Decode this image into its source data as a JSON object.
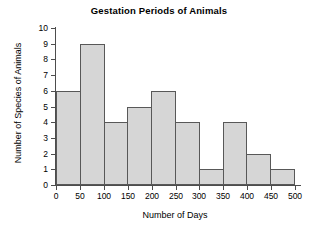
{
  "chart_data": {
    "type": "bar",
    "title": "Gestation Periods of Animals",
    "xlabel": "Number of Days",
    "ylabel": "Number of Species of Animals",
    "categories": [
      "0-50",
      "50-100",
      "100-150",
      "150-200",
      "200-250",
      "250-300",
      "300-350",
      "350-400",
      "400-450",
      "450-500"
    ],
    "bin_edges": [
      0,
      50,
      100,
      150,
      200,
      250,
      300,
      350,
      400,
      450,
      500
    ],
    "values": [
      6,
      9,
      4,
      5,
      6,
      4,
      1,
      4,
      2,
      1
    ],
    "bin_width": 50,
    "xlim": [
      0,
      500
    ],
    "ylim": [
      0,
      10
    ],
    "x_ticks": [
      "0",
      "50",
      "100",
      "150",
      "200",
      "250",
      "300",
      "350",
      "400",
      "450",
      "500"
    ],
    "y_ticks": [
      "10",
      "9",
      "8",
      "7",
      "6",
      "5",
      "4",
      "3",
      "2",
      "1",
      "0"
    ],
    "grid": false,
    "legend": null,
    "bar_fill_color": "#d6d6d6",
    "bar_border_color": "#585858",
    "axis_color": "#4d4d4d",
    "background_color": "#ffffff"
  }
}
